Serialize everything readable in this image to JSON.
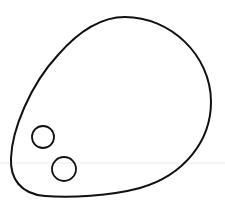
{
  "figure": {
    "colors": {
      "background": "#ffffff",
      "stroke": "#111111",
      "faint_line": "#ececec"
    },
    "outline": {
      "path": "M 125 17 C 170 17, 211 55, 211 102 C 211 140, 185 175, 140 188 C 110 196, 70 198, 45 196 C 20 194, 10 178, 11 158 C 12 130, 30 85, 58 55 C 78 32, 100 17, 125 17 Z",
      "stroke_width": 2
    },
    "circles": [
      {
        "cx": 43,
        "cy": 137,
        "r": 11,
        "stroke_width": 1.8
      },
      {
        "cx": 64,
        "cy": 169,
        "r": 12,
        "stroke_width": 1.8
      }
    ],
    "faint_line": {
      "y": 163
    }
  }
}
